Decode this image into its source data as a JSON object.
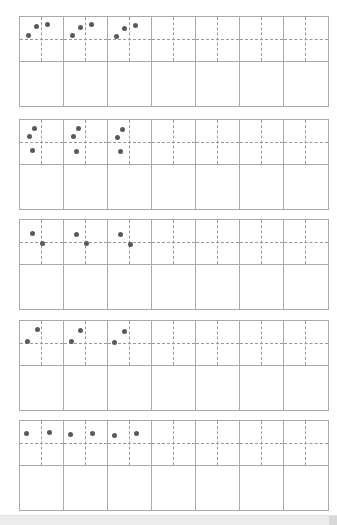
{
  "worksheet": {
    "type": "stroke-practice-grid",
    "columns_per_block": 7,
    "guide_cells_with_dots": 3,
    "colors": {
      "grid_line": "#a9a9a9",
      "dashed_line": "#9a9a9a",
      "dot": "#5a5a5a",
      "background": "#ffffff"
    },
    "blocks": [
      {
        "top": 16,
        "dots_per_cell": [
          [
            [
              8,
              18
            ],
            [
              16,
              9
            ],
            [
              27,
              7
            ]
          ],
          [
            [
              8,
              18
            ],
            [
              16,
              10
            ],
            [
              27,
              7
            ]
          ],
          [
            [
              8,
              19
            ],
            [
              16,
              11
            ],
            [
              27,
              8
            ]
          ]
        ]
      },
      {
        "top": 119,
        "dots_per_cell": [
          [
            [
              14,
              8
            ],
            [
              9,
              16
            ],
            [
              12,
              30
            ]
          ],
          [
            [
              14,
              8
            ],
            [
              9,
              16
            ],
            [
              12,
              31
            ]
          ],
          [
            [
              14,
              9
            ],
            [
              9,
              17
            ],
            [
              12,
              31
            ]
          ]
        ]
      },
      {
        "top": 219,
        "dots_per_cell": [
          [
            [
              12,
              13
            ],
            [
              22,
              23
            ]
          ],
          [
            [
              12,
              14
            ],
            [
              22,
              23
            ]
          ],
          [
            [
              12,
              14
            ],
            [
              22,
              24
            ]
          ]
        ]
      },
      {
        "top": 320,
        "dots_per_cell": [
          [
            [
              17,
              8
            ],
            [
              7,
              20
            ]
          ],
          [
            [
              16,
              9
            ],
            [
              7,
              20
            ]
          ],
          [
            [
              16,
              10
            ],
            [
              6,
              21
            ]
          ]
        ]
      },
      {
        "top": 420,
        "dots_per_cell": [
          [
            [
              6,
              12
            ],
            [
              29,
              11
            ]
          ],
          [
            [
              6,
              13
            ],
            [
              28,
              12
            ]
          ],
          [
            [
              6,
              14
            ],
            [
              28,
              12
            ]
          ]
        ]
      }
    ]
  },
  "scrollbar": {
    "orientation": "horizontal"
  }
}
